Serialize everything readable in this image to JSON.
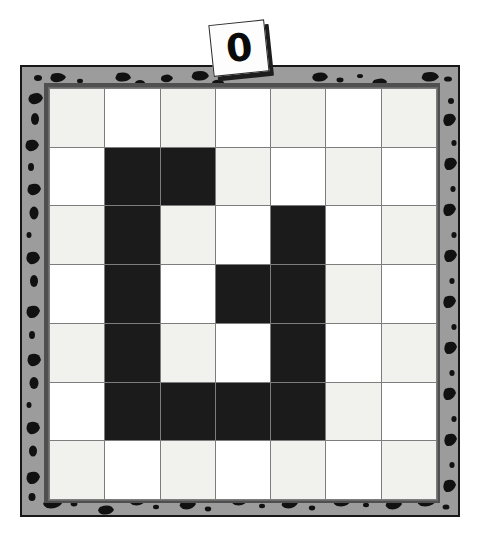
{
  "label": {
    "name": "puzzle-index-card",
    "text": "0"
  },
  "board": {
    "name": "nonogram-board",
    "rows": 7,
    "columns": 7,
    "frame_color": "#9c9c9c",
    "frame_border_color": "#171717",
    "filled_cell_color": "#1b1b1b",
    "empty_cell_color": "#ffffff",
    "empty_cell_alt_color": "#f1f1ee",
    "grid_line_color": "#7d7d7d",
    "cells": [
      [
        0,
        0,
        0,
        0,
        0,
        0,
        0
      ],
      [
        0,
        1,
        1,
        0,
        0,
        0,
        0
      ],
      [
        0,
        1,
        0,
        0,
        1,
        0,
        0
      ],
      [
        0,
        1,
        0,
        1,
        1,
        0,
        0
      ],
      [
        0,
        1,
        0,
        0,
        1,
        0,
        0
      ],
      [
        0,
        1,
        1,
        1,
        1,
        0,
        0
      ],
      [
        0,
        0,
        0,
        0,
        0,
        0,
        0
      ]
    ]
  }
}
